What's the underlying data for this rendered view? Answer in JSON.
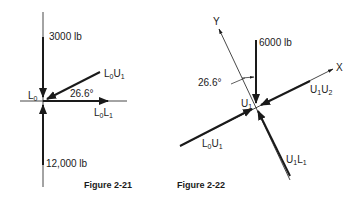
{
  "figures": [
    {
      "caption": "Figure 2-21",
      "joint": {
        "main": "L",
        "sub": "0"
      },
      "forces": {
        "top_load": "3000 lb",
        "bottom_reaction": "12,000 lb"
      },
      "members": [
        {
          "main1": "L",
          "sub1": "0",
          "main2": "U",
          "sub2": "1"
        },
        {
          "main1": "L",
          "sub1": "0",
          "main2": "L",
          "sub2": "1"
        }
      ],
      "angle": "26.6°"
    },
    {
      "caption": "Figure 2-22",
      "joint": {
        "main": "U",
        "sub": "1"
      },
      "axes": {
        "x": "X",
        "y": "Y"
      },
      "forces": {
        "top_load": "6000 lb"
      },
      "members": [
        {
          "main1": "U",
          "sub1": "1",
          "main2": "U",
          "sub2": "2"
        },
        {
          "main1": "L",
          "sub1": "0",
          "main2": "U",
          "sub2": "1"
        },
        {
          "main1": "U",
          "sub1": "1",
          "main2": "L",
          "sub2": "1"
        }
      ],
      "angle": "26.6°"
    }
  ],
  "colors": {
    "ink": "#1a1a1a",
    "background": "#ffffff"
  }
}
